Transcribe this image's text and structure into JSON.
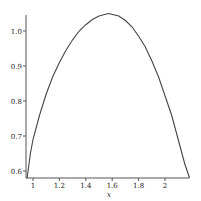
{
  "chart_data": {
    "type": "line",
    "title": "",
    "xlabel": "x",
    "ylabel": "",
    "xlim": [
      0.955,
      2.186
    ],
    "ylim": [
      0.58,
      1.05
    ],
    "grid": false,
    "legend": null,
    "x_ticks": [
      "1",
      "1.2",
      "1.4",
      "1.6",
      "1.8",
      "2"
    ],
    "y_ticks": [
      "0.6",
      "0.7",
      "0.8",
      "0.9",
      "1.0"
    ],
    "series": [
      {
        "name": "f(x)",
        "color": "#444444",
        "x": [
          0.955,
          0.98,
          1.0,
          1.05,
          1.1,
          1.15,
          1.2,
          1.25,
          1.3,
          1.35,
          1.4,
          1.45,
          1.5,
          1.5708,
          1.65,
          1.7,
          1.75,
          1.8,
          1.85,
          1.9,
          1.95,
          2.0,
          2.05,
          2.1,
          2.15,
          2.186
        ],
        "y": [
          0.58,
          0.65,
          0.69,
          0.76,
          0.82,
          0.87,
          0.91,
          0.945,
          0.975,
          1.0,
          1.018,
          1.033,
          1.043,
          1.05,
          1.043,
          1.03,
          1.012,
          0.985,
          0.955,
          0.915,
          0.87,
          0.815,
          0.76,
          0.69,
          0.62,
          0.58
        ]
      }
    ]
  },
  "axes": {
    "x_title": "x",
    "x_tick_labels": [
      "1",
      "1.2",
      "1.4",
      "1.6",
      "1.8",
      "2"
    ],
    "y_tick_labels": [
      "0.6",
      "0.7",
      "0.8",
      "0.9",
      "1.0"
    ]
  }
}
